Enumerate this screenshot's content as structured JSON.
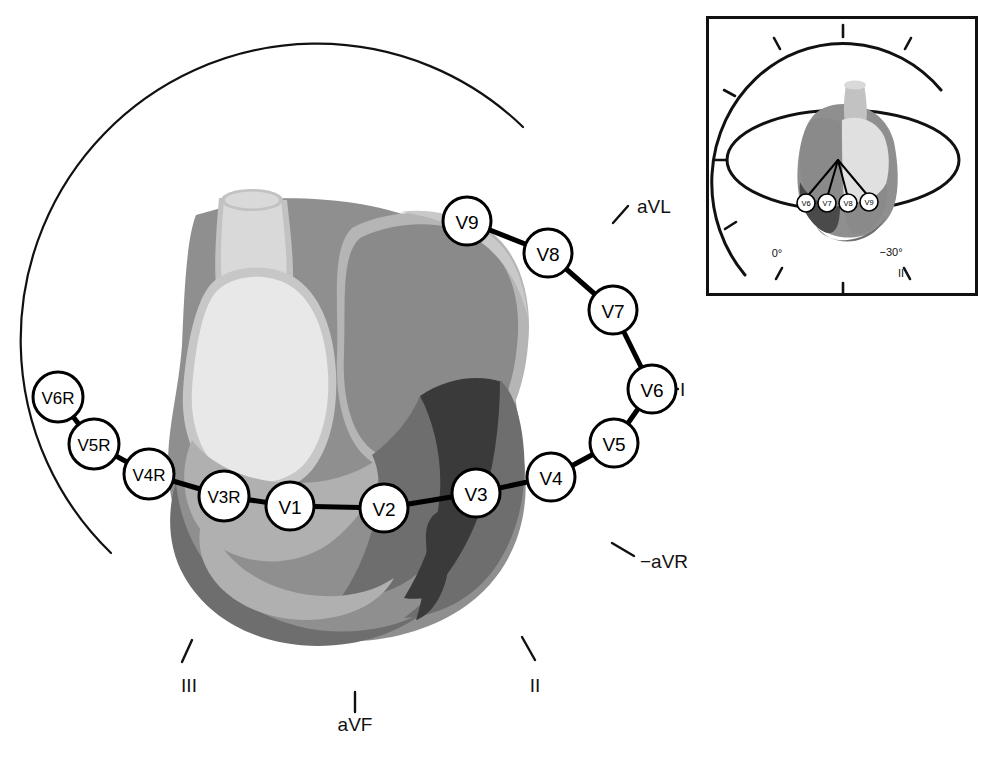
{
  "figure": {
    "background": "#ffffff"
  },
  "colors": {
    "outline": "#111111",
    "electrode_fill": "#ffffff",
    "electrode_stroke": "#000000",
    "connector": "#000000",
    "aorta": "#d9d9d9",
    "aorta_shadow": "#c2c2c2",
    "pulmonary_artery": "#ececec",
    "left_atrium": "#8a8a8a",
    "atrium_rim": "#b5b5b5",
    "left_ventricle_light": "#e8e8e8",
    "ventricle_mid": "#b0b0b0",
    "ventricle_dark": "#6e6e6e",
    "ventricle_darkest": "#3a3a3a",
    "septum": "#9a9a9a",
    "heart_border": "#8f8f8f"
  },
  "main_circle": {
    "label": "horizontal-plane-lead-circle",
    "cx": 355,
    "cy": 418,
    "r": 278,
    "stroke_width": 2.2,
    "arc_start_deg": 151,
    "arc_end_deg": -69
  },
  "axis_labels": [
    {
      "name": "aVL",
      "text": "aVL",
      "x": 637,
      "y": 213,
      "tick_angle_deg": -65,
      "anchor": "start"
    },
    {
      "name": "I",
      "text": "I",
      "x": 680,
      "y": 394,
      "tick_angle_deg": -30,
      "anchor": "start"
    },
    {
      "name": "-aVR",
      "text": "−aVR",
      "x": 640,
      "y": 562,
      "tick_angle_deg": 28,
      "anchor": "start"
    },
    {
      "name": "II",
      "text": "II",
      "x": 535,
      "y": 685,
      "tick_angle_deg": 60,
      "anchor": "middle"
    },
    {
      "name": "aVF",
      "text": "aVF",
      "x": 355,
      "y": 724,
      "tick_angle_deg": 90,
      "anchor": "middle"
    },
    {
      "name": "III",
      "text": "III",
      "x": 189,
      "y": 685,
      "tick_angle_deg": 120,
      "anchor": "middle"
    }
  ],
  "electrodes": [
    {
      "id": "V6R",
      "label": "V6R",
      "x": 58,
      "y": 397,
      "r": 25,
      "size": "small"
    },
    {
      "id": "V5R",
      "label": "V5R",
      "x": 94,
      "y": 444,
      "r": 25,
      "size": "small"
    },
    {
      "id": "V4R",
      "label": "V4R",
      "x": 149,
      "y": 474,
      "r": 25,
      "size": "small"
    },
    {
      "id": "V3R",
      "label": "V3R",
      "x": 224,
      "y": 496,
      "r": 25,
      "size": "small"
    },
    {
      "id": "V1",
      "label": "V1",
      "x": 290,
      "y": 506,
      "r": 24,
      "size": "normal"
    },
    {
      "id": "V2",
      "label": "V2",
      "x": 384,
      "y": 508,
      "r": 24,
      "size": "normal"
    },
    {
      "id": "V3",
      "label": "V3",
      "x": 476,
      "y": 493,
      "r": 24,
      "size": "normal"
    },
    {
      "id": "V4",
      "label": "V4",
      "x": 551,
      "y": 477,
      "r": 24,
      "size": "normal"
    },
    {
      "id": "V5",
      "label": "V5",
      "x": 614,
      "y": 443,
      "r": 24,
      "size": "normal"
    },
    {
      "id": "V6",
      "label": "V6",
      "x": 652,
      "y": 389,
      "r": 24,
      "size": "normal"
    },
    {
      "id": "V7",
      "label": "V7",
      "x": 613,
      "y": 310,
      "r": 24,
      "size": "normal"
    },
    {
      "id": "V8",
      "label": "V8",
      "x": 548,
      "y": 253,
      "r": 24,
      "size": "normal"
    },
    {
      "id": "V9",
      "label": "V9",
      "x": 467,
      "y": 221,
      "r": 24,
      "size": "normal"
    }
  ],
  "electrode_chain_order": [
    "V6R",
    "V5R",
    "V4R",
    "V3R",
    "V1",
    "V2",
    "V3",
    "V4",
    "V5",
    "V6",
    "V7",
    "V8",
    "V9"
  ],
  "inset": {
    "name": "orientation-inset",
    "x": 706,
    "y": 16,
    "width": 272,
    "height": 280,
    "border_color": "#111111",
    "border_width": 3,
    "labels": [
      {
        "name": "zero-degrees",
        "text": "0°",
        "x": 777,
        "y": 253
      },
      {
        "name": "minus-thirty-degrees",
        "text": "−30°",
        "x": 891,
        "y": 252
      },
      {
        "name": "lead-II",
        "text": "II",
        "x": 901,
        "y": 272
      }
    ],
    "electrodes": [
      {
        "id": "V6",
        "label": "V6",
        "x": 806,
        "y": 203,
        "r": 9
      },
      {
        "id": "V7",
        "label": "V7",
        "x": 827,
        "y": 203,
        "r": 9
      },
      {
        "id": "V8",
        "label": "V8",
        "x": 848,
        "y": 203,
        "r": 9
      },
      {
        "id": "V9",
        "label": "V9",
        "x": 869,
        "y": 202,
        "r": 9
      }
    ],
    "ray_origin": {
      "x": 838,
      "y": 160
    }
  }
}
